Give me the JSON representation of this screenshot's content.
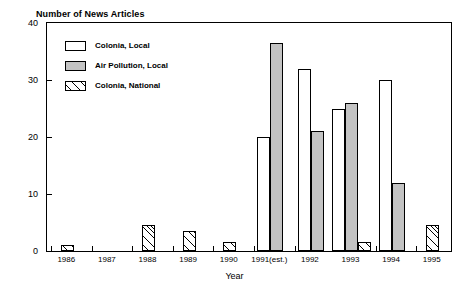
{
  "chart_data": {
    "type": "bar",
    "title": "Number of News Articles",
    "xlabel": "Year",
    "ylabel": "",
    "ylim": [
      0,
      40
    ],
    "yticks": [
      0,
      10,
      20,
      30,
      40
    ],
    "grid": false,
    "legend_position": "inside top-left",
    "categories": [
      "1986",
      "1987",
      "1988",
      "1989",
      "1990",
      "1991(est.)",
      "1992",
      "1993",
      "1994",
      "1995"
    ],
    "series": [
      {
        "name": "Colonia, Local",
        "style": "white",
        "values": [
          0,
          0,
          0,
          0,
          0,
          20,
          32,
          25,
          30,
          0
        ]
      },
      {
        "name": "Air Pollution, Local",
        "style": "gray",
        "values": [
          0,
          0,
          0,
          0,
          0,
          36.5,
          21,
          26,
          12,
          0
        ]
      },
      {
        "name": "Colonia, National",
        "style": "hatch",
        "values": [
          1,
          0,
          4.5,
          3.5,
          1.5,
          0,
          0,
          1.5,
          0,
          4.5
        ]
      }
    ]
  },
  "legend": {
    "items": [
      {
        "label": "Colonia, Local",
        "style": "white"
      },
      {
        "label": "Air Pollution, Local",
        "style": "gray"
      },
      {
        "label": "Colonia, National",
        "style": "hatch"
      }
    ]
  },
  "colors": {
    "gray_fill": "#c3c3c3",
    "outline": "#000000",
    "background": "#ffffff"
  }
}
